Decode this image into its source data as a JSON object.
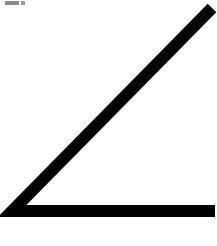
{
  "figure": {
    "type": "angle",
    "stroke_color": "#000000",
    "stroke_width": 12,
    "background": "#ffffff",
    "vertex": [
      12,
      211
    ],
    "ray_end_diagonal": [
      212,
      8
    ],
    "ray_end_horizontal": [
      215,
      211
    ]
  },
  "marker": {
    "color": "#8a8a8a"
  }
}
